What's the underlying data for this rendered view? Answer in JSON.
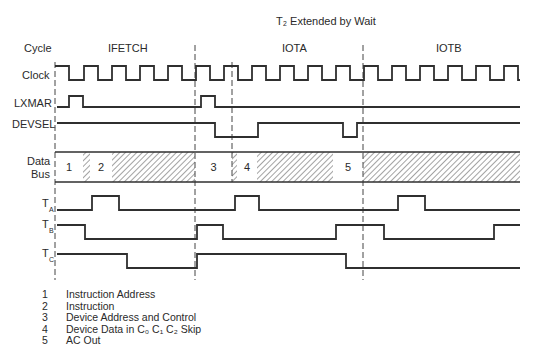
{
  "diagram": {
    "title": "T₂ Extended by Wait",
    "cycle_label": "Cycle",
    "cycles": [
      {
        "name": "IFETCH",
        "x_label": 140
      },
      {
        "name": "IOTA",
        "x_label": 284
      },
      {
        "name": "IOTB",
        "x_label": 442
      }
    ],
    "signals": [
      {
        "id": "clock",
        "label": "Clock"
      },
      {
        "id": "lxmar",
        "label": "LXMAR"
      },
      {
        "id": "devsel",
        "label": "DEVSEL"
      },
      {
        "id": "databus",
        "label_line1": "Data",
        "label_line2": "Bus"
      },
      {
        "id": "ta",
        "label": "T",
        "sub": "A"
      },
      {
        "id": "tb",
        "label": "T",
        "sub": "B"
      },
      {
        "id": "tc",
        "label": "T",
        "sub": "C"
      }
    ],
    "boundaries_x": [
      55,
      195,
      232,
      363
    ],
    "clock": {
      "high_y": 66,
      "low_y": 80,
      "start_x": 55,
      "end_x": 520,
      "rising_edges_x": [
        84,
        112,
        140,
        168,
        196,
        224,
        252,
        280,
        308,
        336,
        364,
        392,
        420,
        448,
        476,
        504
      ],
      "half_period": 14,
      "first_fall_x": 69
    },
    "lxmar": {
      "low_y": 107,
      "high_y": 96,
      "pulses": [
        [
          69,
          83
        ],
        [
          201,
          215
        ]
      ]
    },
    "devsel": {
      "high_y": 123,
      "low_y": 137,
      "low_intervals": [
        [
          215,
          258
        ],
        [
          343,
          357
        ]
      ]
    },
    "databus": {
      "top_y": 152,
      "bottom_y": 182,
      "start_x": 55,
      "end_x": 520,
      "segments": [
        {
          "from": 55,
          "to": 83,
          "type": "valid",
          "label": "1"
        },
        {
          "from": 83,
          "to": 90,
          "type": "hatch"
        },
        {
          "from": 90,
          "to": 112,
          "type": "valid",
          "label": "2"
        },
        {
          "from": 112,
          "to": 195,
          "type": "hatch"
        },
        {
          "from": 195,
          "to": 232,
          "type": "valid",
          "label": "3"
        },
        {
          "from": 232,
          "to": 237,
          "type": "hatch"
        },
        {
          "from": 237,
          "to": 257,
          "type": "valid",
          "label": "4"
        },
        {
          "from": 257,
          "to": 333,
          "type": "hatch"
        },
        {
          "from": 333,
          "to": 363,
          "type": "valid",
          "label": "5"
        },
        {
          "from": 363,
          "to": 520,
          "type": "hatch"
        }
      ]
    },
    "ta": {
      "low_y": 210,
      "high_y": 196,
      "pulses": [
        [
          92,
          119
        ],
        [
          235,
          259
        ],
        [
          398,
          425
        ]
      ]
    },
    "tb": {
      "high_y": 225,
      "low_y": 239,
      "high_intervals": [
        [
          57,
          85
        ],
        [
          197,
          223
        ],
        [
          336,
          384
        ],
        [
          494,
          520
        ]
      ]
    },
    "tc": {
      "high_y": 254,
      "low_y": 268,
      "high_intervals": [
        [
          57,
          127
        ],
        [
          197,
          346
        ]
      ]
    },
    "legend": [
      {
        "num": "1",
        "text": "Instruction Address"
      },
      {
        "num": "2",
        "text": "Instruction"
      },
      {
        "num": "3",
        "text": "Device Address and Control"
      },
      {
        "num": "4",
        "text": "Device Data in C₀ C₁ C₂ Skip"
      },
      {
        "num": "5",
        "text": "AC Out"
      }
    ]
  }
}
